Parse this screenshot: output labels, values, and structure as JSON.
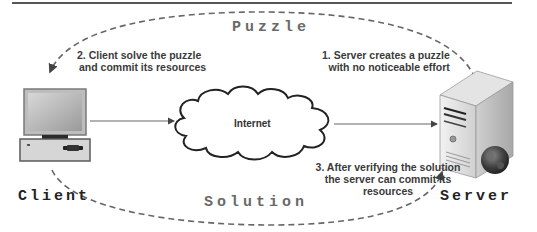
{
  "diagram": {
    "type": "client-puzzle-protocol",
    "nodes": {
      "client": {
        "label": "Client",
        "icon": "desktop-computer-icon"
      },
      "internet": {
        "label": "Internet",
        "icon": "cloud-icon"
      },
      "server": {
        "label": "Server",
        "icon": "server-tower-icon"
      }
    },
    "flows": {
      "top_arc": {
        "label": "Puzzle",
        "direction": "server-to-client"
      },
      "bottom_arc": {
        "label": "Solution",
        "direction": "client-to-server"
      }
    },
    "steps": {
      "step1": {
        "line1": "1. Server creates a puzzle",
        "line2": "with no noticeable effort"
      },
      "step2": {
        "line1": "2. Client solve the puzzle",
        "line2": "and commit its resources"
      },
      "step3": {
        "line1": "3. After verifying the solution",
        "line2": "the server can commit its",
        "line3": "resources"
      }
    },
    "colors": {
      "line": "#555555",
      "dashed_arc": "#666666",
      "text": "#3a3a3a",
      "background": "#ffffff"
    }
  }
}
